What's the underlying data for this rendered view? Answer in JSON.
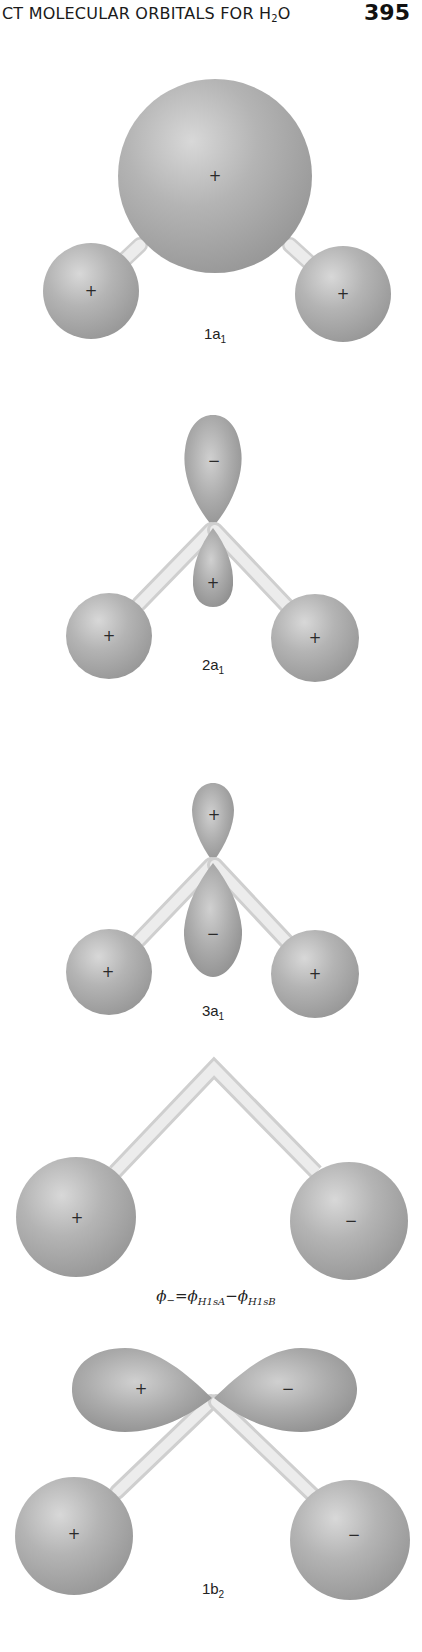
{
  "header": {
    "running_head_main": "CT MOLECULAR ORBITALS FOR H",
    "running_head_sub": "2",
    "running_head_tail": "O",
    "page_number": "395"
  },
  "colors": {
    "lobe_fill": "#a9a9a9",
    "lobe_highlight": "#d6d6d6",
    "lobe_shadow": "#8a8a8a",
    "bond_fill": "#e6e6e6",
    "bond_edge": "#c4c4c4",
    "text": "#222222"
  },
  "orbitals": [
    {
      "id": "1a1",
      "label_main": "1a",
      "label_sub": "1",
      "signs": {
        "oxygen": "+",
        "h_left": "+",
        "h_right": "+"
      }
    },
    {
      "id": "2a1",
      "label_main": "2a",
      "label_sub": "1",
      "signs": {
        "upper_lobe": "−",
        "lower_lobe": "+",
        "h_left": "+",
        "h_right": "+"
      }
    },
    {
      "id": "3a1",
      "label_main": "3a",
      "label_sub": "1",
      "signs": {
        "upper_lobe": "+",
        "lower_lobe": "−",
        "h_left": "+",
        "h_right": "+"
      }
    },
    {
      "id": "phi-minus",
      "equation": {
        "lhs": "ϕ",
        "lhs_sub": "−",
        "equals": "=",
        "term1": "ϕ",
        "term1_sub": "H1sA",
        "minus": "−",
        "term2": "ϕ",
        "term2_sub": "H1sB"
      },
      "signs": {
        "h_left": "+",
        "h_right": "−"
      }
    },
    {
      "id": "1b2",
      "label_main": "1b",
      "label_sub": "2",
      "signs": {
        "left_lobe": "+",
        "right_lobe": "−",
        "h_left": "+",
        "h_right": "−"
      }
    }
  ]
}
